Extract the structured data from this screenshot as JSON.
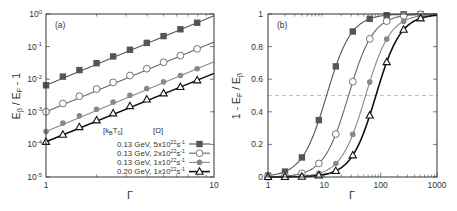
{
  "chart_data": [
    {
      "panel": "(a)",
      "type": "line",
      "xscale": "log",
      "yscale": "log",
      "xlabel": "Γ",
      "ylabel": "E_β / E_F - 1",
      "xlim": [
        1,
        10
      ],
      "ylim": [
        1e-05,
        1
      ],
      "xticks": [
        "1",
        "10"
      ],
      "yticks": [
        "10^0",
        "10^-1",
        "10^-2",
        "10^-3",
        "10^-4",
        "10^-5"
      ],
      "legend_header": [
        "[k_B T_0]",
        "[Ω]"
      ],
      "x": [
        1,
        1.26,
        1.58,
        2,
        2.51,
        3.16,
        3.98,
        5.01,
        6.31,
        7.94
      ],
      "series": [
        {
          "name": "0.13 GeV, 5x10^22 s^-1",
          "marker": "filled-square",
          "color": "#555555",
          "values": [
            0.0065,
            0.012,
            0.019,
            0.031,
            0.05,
            0.08,
            0.13,
            0.21,
            0.34,
            0.54
          ]
        },
        {
          "name": "0.13 GeV, 2x10^22 s^-1",
          "marker": "open-circle",
          "color": "#666666",
          "values": [
            0.001,
            0.0018,
            0.003,
            0.005,
            0.008,
            0.013,
            0.021,
            0.033,
            0.053,
            0.085
          ]
        },
        {
          "name": "0.13 GeV, 1x10^22 s^-1",
          "marker": "filled-circle",
          "color": "#888888",
          "values": [
            0.00025,
            0.00045,
            0.00075,
            0.0012,
            0.002,
            0.0032,
            0.0052,
            0.0083,
            0.013,
            0.021
          ]
        },
        {
          "name": "0.20 GeV, 1x10^22 s^-1",
          "marker": "open-triangle",
          "color": "#111111",
          "values": [
            0.00012,
            0.0002,
            0.00034,
            0.00055,
            0.0009,
            0.0015,
            0.0024,
            0.0037,
            0.0058,
            0.0093
          ]
        }
      ]
    },
    {
      "panel": "(b)",
      "type": "line",
      "xscale": "log",
      "yscale": "linear",
      "xlabel": "Γ",
      "ylabel": "1 - E_F / E_β",
      "xlim": [
        1,
        1000
      ],
      "ylim": [
        0,
        1
      ],
      "xticks": [
        "1",
        "10",
        "100",
        "1000"
      ],
      "yticks": [
        "0",
        "0.2",
        "0.4",
        "0.6",
        "0.8",
        "1"
      ],
      "reference_line": {
        "y": 0.5,
        "style": "dashed"
      },
      "x": [
        1,
        2,
        4,
        8,
        16,
        32,
        64,
        128,
        256,
        512
      ],
      "series": [
        {
          "name": "0.13 GeV, 5x10^22 s^-1",
          "marker": "filled-square",
          "color": "#555555",
          "values": [
            0.005,
            0.03,
            0.12,
            0.35,
            0.68,
            0.9,
            0.97,
            0.995,
            1.0,
            1.0
          ]
        },
        {
          "name": "0.13 GeV, 2x10^22 s^-1",
          "marker": "open-circle",
          "color": "#666666",
          "values": [
            0.0,
            0.005,
            0.02,
            0.08,
            0.26,
            0.58,
            0.85,
            0.97,
            0.995,
            1.0
          ]
        },
        {
          "name": "0.13 GeV, 1x10^22 s^-1",
          "marker": "filled-circle",
          "color": "#888888",
          "values": [
            0.0,
            0.0,
            0.005,
            0.02,
            0.08,
            0.25,
            0.58,
            0.84,
            0.96,
            0.995
          ]
        },
        {
          "name": "0.20 GeV, 1x10^22 s^-1",
          "marker": "open-triangle",
          "color": "#111111",
          "values": [
            0.0,
            0.0,
            0.002,
            0.01,
            0.035,
            0.13,
            0.38,
            0.71,
            0.91,
            0.98
          ]
        }
      ]
    }
  ],
  "labels": {
    "panel_a": "(a)",
    "panel_b": "(b)",
    "gamma": "Γ",
    "legend_kbt": "[k",
    "legend_kbt_sub1": "B",
    "legend_kbt_mid": "T",
    "legend_kbt_sub2": "0",
    "legend_kbt_end": "]",
    "legend_omega": "[Ω]",
    "legend_rows": [
      {
        "pre": "0.13 GeV, 5x10",
        "exp": "22",
        "post": "s",
        "exp2": "-1"
      },
      {
        "pre": "0.13 GeV, 2x10",
        "exp": "22",
        "post": "s",
        "exp2": "-1"
      },
      {
        "pre": "0.13 GeV, 1x10",
        "exp": "22",
        "post": "s",
        "exp2": "-1"
      },
      {
        "pre": "0.20 GeV, 1x10",
        "exp": "22",
        "post": "s",
        "exp2": "-1"
      }
    ]
  }
}
